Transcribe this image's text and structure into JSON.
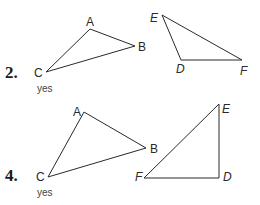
{
  "problems": [
    {
      "number": "2.",
      "answer": "yes",
      "triangle_1": {
        "labels": {
          "A": "A",
          "B": "B",
          "C": "C"
        },
        "style": "upright"
      },
      "triangle_2": {
        "labels": {
          "E": "E",
          "D": "D",
          "F": "F"
        },
        "style": "italic"
      }
    },
    {
      "number": "4.",
      "answer": "yes",
      "triangle_1": {
        "labels": {
          "A": "A",
          "B": "B",
          "C": "C"
        },
        "style": "upright"
      },
      "triangle_2": {
        "labels": {
          "E": "E",
          "F": "F",
          "D": "D"
        },
        "style": "italic"
      }
    }
  ]
}
